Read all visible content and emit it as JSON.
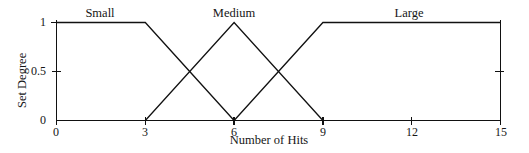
{
  "chart_data": {
    "type": "line",
    "title": "",
    "xlabel": "Number of Hits",
    "ylabel": "Set Degree",
    "xlim": [
      0,
      15
    ],
    "ylim": [
      0,
      1
    ],
    "xticks": [
      0,
      3,
      6,
      9,
      12,
      15
    ],
    "xtick_labels": [
      "0",
      "3",
      "6",
      "9",
      "12",
      "15"
    ],
    "yticks": [
      0,
      0.5,
      1
    ],
    "ytick_labels": [
      "0",
      "0.5",
      "1"
    ],
    "grid": false,
    "legend_position": "inline-above-curves",
    "annotations": [
      {
        "text": "Small",
        "x": 1.5,
        "y": 1.0
      },
      {
        "text": "Medium",
        "x": 6.0,
        "y": 1.0
      },
      {
        "text": "Large",
        "x": 11.6,
        "y": 1.0
      }
    ],
    "series": [
      {
        "name": "Small",
        "x": [
          0,
          3,
          6
        ],
        "values": [
          1,
          1,
          0
        ]
      },
      {
        "name": "Medium",
        "x": [
          3,
          6,
          9
        ],
        "values": [
          0,
          1,
          0
        ]
      },
      {
        "name": "Large",
        "x": [
          6,
          9,
          15
        ],
        "values": [
          0,
          1,
          1
        ]
      }
    ]
  },
  "labels": {
    "series_small": "Small",
    "series_medium": "Medium",
    "series_large": "Large",
    "axis_x_title": "Number of Hits",
    "axis_y_title": "Set Degree",
    "x_tick_0": "0",
    "x_tick_1": "3",
    "x_tick_2": "6",
    "x_tick_3": "9",
    "x_tick_4": "12",
    "x_tick_5": "15",
    "y_tick_0": "0",
    "y_tick_1": "0.5",
    "y_tick_2": "1"
  },
  "colors": {
    "line": "#111111",
    "axis": "#111111",
    "text": "#161616",
    "background": "#ffffff"
  }
}
